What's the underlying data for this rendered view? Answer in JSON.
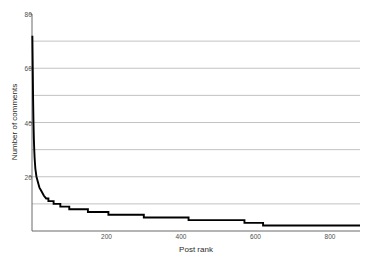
{
  "chart_data": {
    "type": "line",
    "title": "",
    "xlabel": "Post rank",
    "ylabel": "Number of comments",
    "xlim": [
      0,
      880
    ],
    "ylim": [
      0,
      80
    ],
    "grid": true,
    "grid_axis": "y",
    "grid_interval": 10,
    "legend": "none",
    "xticks": [
      200,
      400,
      600,
      800
    ],
    "yticks": [
      20,
      40,
      60,
      80
    ],
    "gridline_values": [
      10,
      20,
      30,
      40,
      50,
      60,
      70
    ],
    "series": [
      {
        "name": "comments per post",
        "x": [
          1,
          2,
          3,
          4,
          5,
          6,
          7,
          8,
          9,
          10,
          12,
          14,
          16,
          18,
          20,
          24,
          28,
          32,
          38,
          44,
          50,
          58,
          66,
          76,
          86,
          100,
          115,
          130,
          150,
          170,
          190,
          205,
          225,
          250,
          275,
          300,
          330,
          360,
          390,
          420,
          450,
          480,
          510,
          540,
          570,
          600,
          620,
          660,
          700,
          750,
          800,
          850,
          880
        ],
        "y": [
          72,
          60,
          48,
          40,
          34,
          30,
          27,
          25,
          23,
          22,
          20,
          19,
          18,
          17,
          16,
          15,
          14,
          13,
          12,
          11,
          11,
          10,
          10,
          9,
          9,
          8,
          8,
          8,
          7,
          7,
          7,
          6,
          6,
          6,
          6,
          5,
          5,
          5,
          5,
          4,
          4,
          4,
          4,
          4,
          3,
          3,
          2,
          2,
          2,
          2,
          2,
          2,
          2
        ]
      }
    ]
  },
  "axes": {
    "x_tick_labels": [
      "200",
      "400",
      "600",
      "800"
    ],
    "y_tick_labels": [
      "20",
      "40",
      "60",
      "80"
    ],
    "x_axis_title": "Post rank",
    "y_axis_title": "Number of comments"
  },
  "colors": {
    "line": "#000000",
    "grid": "#b3b3b3",
    "frame": "#5a5a5a",
    "tick_text": "#4d4d4d",
    "axis_title": "#2b2b2b",
    "background": "#ffffff"
  }
}
